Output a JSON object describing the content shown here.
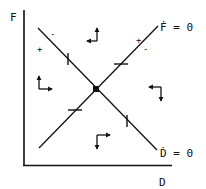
{
  "diagram": {
    "type": "phase-diagram",
    "axes": {
      "x_label": "D",
      "y_label": "F"
    },
    "isoclines": [
      {
        "id": "f-dot-zero",
        "label": "Ḟ = 0",
        "orientation": "rising",
        "signs": {
          "above": "+",
          "below": "-"
        }
      },
      {
        "id": "d-dot-zero",
        "label": "Ḋ = 0",
        "orientation": "falling",
        "signs": {
          "above": "-",
          "below": "+"
        }
      }
    ],
    "equilibrium": {
      "marker": "filled-square"
    },
    "phase_arrows": [
      {
        "region": "top",
        "directions": [
          "left",
          "up"
        ]
      },
      {
        "region": "left",
        "directions": [
          "up",
          "right"
        ]
      },
      {
        "region": "right",
        "directions": [
          "left",
          "down"
        ]
      },
      {
        "region": "bottom",
        "directions": [
          "down",
          "right"
        ]
      }
    ],
    "ticks": {
      "on_d_dot_zero": "vertical",
      "on_f_dot_zero": "horizontal"
    },
    "text": {
      "f_label": "F",
      "d_label": "D",
      "f_dot_zero": "Ḟ = 0",
      "d_dot_zero": "Ḋ = 0",
      "plus": "+",
      "minus": "-"
    }
  }
}
